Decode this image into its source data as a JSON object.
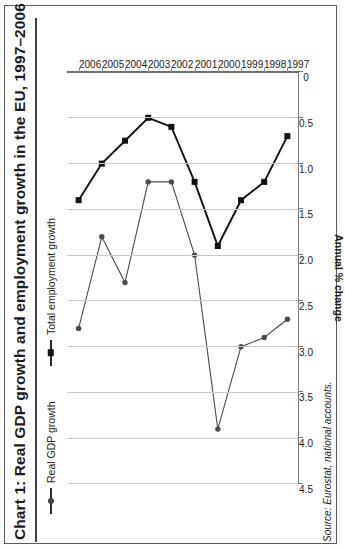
{
  "figure": {
    "title": "Chart 1: Real GDP growth and employment growth in the EU, 1997–2006",
    "source": "Source: Eurostat, national accounts.",
    "axis_title": "Annual % change"
  },
  "legend": {
    "items": [
      {
        "label": "Real GDP growth",
        "marker": "circle-marker",
        "color": "#444444"
      },
      {
        "label": "Total employment growth",
        "marker": "square-marker",
        "color": "#111111"
      }
    ]
  },
  "chart_data": {
    "type": "line",
    "title": "Chart 1: Real GDP growth and employment growth in the EU, 1997–2006",
    "xlabel": "",
    "ylabel": "Annual % change",
    "categories": [
      "1997",
      "1998",
      "1999",
      "2000",
      "2001",
      "2002",
      "2003",
      "2004",
      "2005",
      "2006"
    ],
    "tick_labels": [
      "4.5",
      "4.0",
      "3.5",
      "3.0",
      "2.5",
      "2.0",
      "1.5",
      "1.0",
      "0.5",
      "0"
    ],
    "ylim": [
      0,
      4.5
    ],
    "grid": true,
    "legend_position": "top-left",
    "orientation": "rotated-90-ccw",
    "series": [
      {
        "name": "Real GDP growth",
        "marker": "circle",
        "values": [
          2.7,
          2.9,
          3.0,
          3.9,
          2.0,
          1.2,
          1.2,
          2.3,
          1.8,
          2.8
        ]
      },
      {
        "name": "Total employment growth",
        "marker": "square",
        "values": [
          0.7,
          1.2,
          1.4,
          1.9,
          1.2,
          0.6,
          0.5,
          0.75,
          1.0,
          1.4
        ]
      }
    ]
  }
}
